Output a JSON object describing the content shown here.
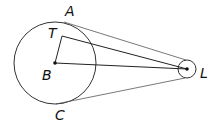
{
  "diagram": {
    "labels": {
      "A": "A",
      "T": "T",
      "B": "B",
      "C": "C",
      "L": "L"
    },
    "large_circle": {
      "center": "B",
      "cx": 55,
      "cy": 63,
      "r": 41
    },
    "small_circle": {
      "center": "L",
      "cx": 187,
      "cy": 69,
      "r": 9
    },
    "segments": [
      "B-T",
      "T-L",
      "B-L",
      "A-tangent-top",
      "C-tangent-bottom"
    ],
    "colors": {
      "stroke": "#222222",
      "background": "#ffffff"
    }
  }
}
